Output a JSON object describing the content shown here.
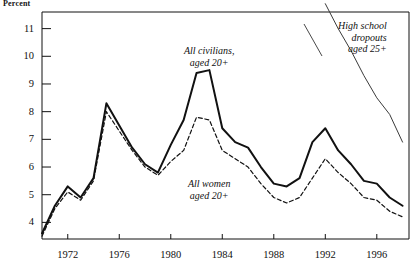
{
  "chart_data": {
    "type": "line",
    "title": "",
    "subtitle": "",
    "xlabel": "",
    "ylabel": "Percent",
    "xlim": [
      1970.0,
      1998.5
    ],
    "ylim": [
      3.4,
      11.6
    ],
    "grid": false,
    "legend_position": "inline-annotations",
    "xticks": [
      1972,
      1976,
      1980,
      1984,
      1988,
      1992,
      1996
    ],
    "xtick_labels": [
      "1972",
      "1976",
      "1980",
      "1984",
      "1988",
      "1992",
      "1996"
    ],
    "yticks": [
      4,
      5,
      6,
      7,
      8,
      9,
      10,
      11
    ],
    "ytick_labels": [
      "4",
      "5",
      "6",
      "7",
      "8",
      "9",
      "10",
      "11"
    ],
    "series": [
      {
        "name": "All civilians, aged 20+",
        "style": "solid",
        "color": "#111111",
        "width": 2.0,
        "x": [
          1970,
          1971,
          1972,
          1973,
          1974,
          1975,
          1976,
          1977,
          1978,
          1979,
          1980,
          1981,
          1982,
          1983,
          1984,
          1985,
          1986,
          1987,
          1988,
          1989,
          1990,
          1991,
          1992,
          1993,
          1994,
          1995,
          1996,
          1997,
          1998
        ],
        "values": [
          3.6,
          4.6,
          5.3,
          4.9,
          5.6,
          8.3,
          7.5,
          6.7,
          6.1,
          5.8,
          6.8,
          7.7,
          9.4,
          9.5,
          7.4,
          6.9,
          6.7,
          6.0,
          5.4,
          5.3,
          5.6,
          6.9,
          7.4,
          6.6,
          6.1,
          5.5,
          5.4,
          4.9,
          4.6
        ]
      },
      {
        "name": "All women aged 20+",
        "style": "dashed",
        "color": "#111111",
        "width": 1.2,
        "x": [
          1970,
          1971,
          1972,
          1973,
          1974,
          1975,
          1976,
          1977,
          1978,
          1979,
          1980,
          1981,
          1982,
          1983,
          1984,
          1985,
          1986,
          1987,
          1988,
          1989,
          1990,
          1991,
          1992,
          1993,
          1994,
          1995,
          1996,
          1997,
          1998
        ],
        "values": [
          3.5,
          4.5,
          5.1,
          4.8,
          5.5,
          8.0,
          7.3,
          6.6,
          6.0,
          5.7,
          6.2,
          6.6,
          7.8,
          7.7,
          6.6,
          6.3,
          6.0,
          5.4,
          4.9,
          4.7,
          4.9,
          5.6,
          6.3,
          5.8,
          5.4,
          4.9,
          4.8,
          4.4,
          4.2
        ]
      },
      {
        "name": "High school dropouts aged 25+",
        "style": "solid-thin",
        "color": "#3a3a3a",
        "width": 1.0,
        "x": [
          1992,
          1993,
          1994,
          1995,
          1996,
          1997,
          1998
        ],
        "values": [
          11.9,
          11.0,
          10.2,
          9.3,
          8.5,
          7.9,
          6.9
        ]
      }
    ],
    "annotations": [
      {
        "text_lines": [
          "All civilians,",
          "aged 20+"
        ],
        "align": "center",
        "x": 1983.0,
        "y": 10.4
      },
      {
        "text_lines": [
          "All women",
          "aged 20+"
        ],
        "align": "center",
        "x": 1983.0,
        "y": 5.6
      },
      {
        "text_lines": [
          "High school",
          "dropouts",
          "aged 25+"
        ],
        "align": "right",
        "x": 1996.8,
        "y": 11.3
      }
    ]
  }
}
